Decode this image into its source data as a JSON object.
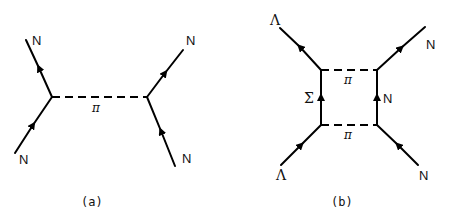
{
  "diagram_a": {
    "caption": "(a)",
    "exchange_label": "π",
    "legs": {
      "upper_left": "N",
      "lower_left": "N",
      "upper_right": "N",
      "lower_right": "N"
    }
  },
  "diagram_b": {
    "caption": "(b)",
    "top_exchange_label": "π",
    "bottom_exchange_label": "π",
    "left_internal_label": "Σ",
    "right_internal_label": "N",
    "legs": {
      "upper_left": "Λ",
      "lower_left": "Λ",
      "upper_right": "N",
      "lower_right": "N"
    }
  }
}
